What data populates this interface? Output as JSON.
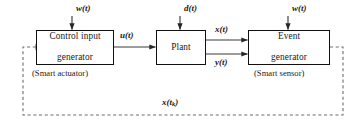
{
  "diagram": {
    "type": "block-diagram",
    "colors": {
      "block_border": "#101010",
      "solid_signal": "#3a3a3a",
      "dashed_feedback": "#6e6e6e",
      "background": "#ffffff"
    },
    "blocks": [
      {
        "id": "control-input-generator",
        "label_line1": "Control input",
        "label_line2": "generator",
        "caption": "(Smart actuator)"
      },
      {
        "id": "plant",
        "label_line1": "Plant",
        "label_line2": "",
        "caption": ""
      },
      {
        "id": "event-generator",
        "label_line1": "Event",
        "label_line2": "generator",
        "caption": "(Smart sensor)"
      }
    ],
    "signals": {
      "disturbance_left": "w(t)",
      "disturbance_center": "d(t)",
      "disturbance_right": "w(t)",
      "control_input": "u(t)",
      "state_output": "x(t)",
      "measured_output": "y(t)",
      "sampled_state_base": "x(t",
      "sampled_state_sub": "k",
      "sampled_state_close": ")"
    }
  }
}
